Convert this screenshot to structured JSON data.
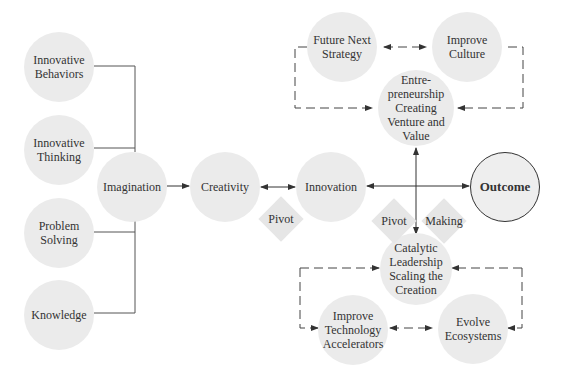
{
  "diagram": {
    "colors": {
      "node_fill": "#ebebeb",
      "line": "#555555",
      "text": "#333333",
      "outcome_border": "#333333"
    },
    "nodes": {
      "innovative_behaviors": "Innovative\nBehaviors",
      "innovative_thinking": "Innovative\nThinking",
      "problem_solving": "Problem\nSolving",
      "knowledge": "Knowledge",
      "imagination": "Imagination",
      "creativity": "Creativity",
      "innovation": "Innovation",
      "outcome": "Outcome",
      "future_next_strategy": "Future Next\nStrategy",
      "improve_culture": "Improve\nCulture",
      "entrepreneurship": "Entre-\npreneurship\nCreating\nVenture and\nValue",
      "catalytic_leadership": "Catalytic\nLeadership\nScaling the\nCreation",
      "improve_technology": "Improve\nTechnology\nAccelerators",
      "evolve_ecosystems": "Evolve\nEcosystems"
    },
    "diamonds": {
      "pivot_left": "Pivot",
      "pivot_right": "Pivot",
      "making": "Making"
    },
    "edges": [
      {
        "from": "Innovative Behaviors",
        "to": "Imagination",
        "style": "solid-bracket"
      },
      {
        "from": "Innovative Thinking",
        "to": "Imagination",
        "style": "solid-bracket"
      },
      {
        "from": "Problem Solving",
        "to": "Imagination",
        "style": "solid-bracket"
      },
      {
        "from": "Knowledge",
        "to": "Imagination",
        "style": "solid-bracket"
      },
      {
        "from": "Imagination",
        "to": "Creativity",
        "style": "solid-arrow"
      },
      {
        "from": "Creativity",
        "to": "Innovation",
        "style": "solid-double-arrow"
      },
      {
        "from": "Innovation",
        "to": "Outcome",
        "style": "solid-double-arrow"
      },
      {
        "from": "Entrepreneurship Creating Venture and Value",
        "to": "Catalytic Leadership Scaling the Creation",
        "style": "solid-double-arrow"
      },
      {
        "from": "Future Next Strategy",
        "to": "Improve Culture",
        "style": "dashed-double-arrow"
      },
      {
        "from": "Future Next Strategy",
        "to": "Entrepreneurship Creating Venture and Value",
        "style": "dashed-loop"
      },
      {
        "from": "Improve Culture",
        "to": "Entrepreneurship Creating Venture and Value",
        "style": "dashed-loop"
      },
      {
        "from": "Catalytic Leadership Scaling the Creation",
        "to": "Improve Technology Accelerators",
        "style": "dashed-loop"
      },
      {
        "from": "Catalytic Leadership Scaling the Creation",
        "to": "Evolve Ecosystems",
        "style": "dashed-loop"
      },
      {
        "from": "Improve Technology Accelerators",
        "to": "Evolve Ecosystems",
        "style": "dashed-double-arrow"
      }
    ]
  }
}
